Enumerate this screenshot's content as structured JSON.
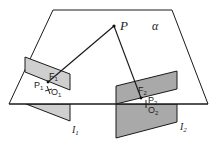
{
  "diagram": {
    "plane_label": "α",
    "point_P": "P",
    "image_plane_1": {
      "label": "I",
      "sub": "1",
      "focus": "F",
      "focus_sub": "1",
      "point": "P",
      "point_sub": "1",
      "origin": "O",
      "origin_sub": "1"
    },
    "image_plane_2": {
      "label": "I",
      "sub": "2",
      "focus": "F",
      "focus_sub": "2",
      "point": "P",
      "point_sub": "2",
      "origin": "O",
      "origin_sub": "2"
    },
    "colors": {
      "plane_fill": "#ffffff",
      "image_plane_1_fill": "#cfcfcf",
      "image_plane_2_fill": "#a9a9a9",
      "stroke": "#1a1a1a"
    }
  }
}
